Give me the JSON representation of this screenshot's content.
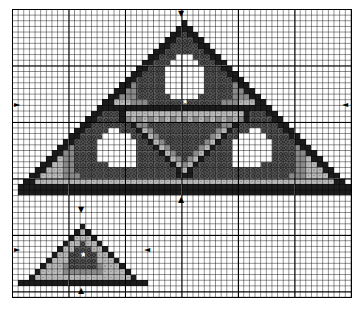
{
  "chart_data": {
    "type": "heatmap",
    "title": "",
    "grid": {
      "columns": 60,
      "rows": 51,
      "major_every": 10,
      "cell_px": 5.65
    },
    "legend": {
      "K": {
        "name": "black",
        "color": "#1c1c1c"
      },
      "D": {
        "name": "dark-gray-symbol",
        "color": "#5e5e5e"
      },
      "M": {
        "name": "medium-gray",
        "color": "#8a8a8a"
      },
      "L": {
        "name": "light-gray-symbol",
        "color": "#b9b9b9"
      },
      "W": {
        "name": "white",
        "color": "#ffffff"
      },
      "S": {
        "name": "center-star",
        "color": "#ffffff"
      }
    },
    "star_glyph": "★",
    "rows": [
      {
        "r": 2,
        "start": 30,
        "cells": "K"
      },
      {
        "r": 3,
        "start": 29,
        "cells": "KKK"
      },
      {
        "r": 4,
        "start": 28,
        "cells": "KKDKK"
      },
      {
        "r": 5,
        "start": 27,
        "cells": "KKDDDKK"
      },
      {
        "r": 6,
        "start": 26,
        "cells": "KKDDDDDKK"
      },
      {
        "r": 7,
        "start": 25,
        "cells": "KKDDDDDDDKK"
      },
      {
        "r": 8,
        "start": 24,
        "cells": "KKDDDWWWDDDKK"
      },
      {
        "r": 9,
        "start": 23,
        "cells": "KKDDDWWWWWDDDKK"
      },
      {
        "r": 10,
        "start": 22,
        "cells": "KKDDDWWWWWWWDDDKK"
      },
      {
        "r": 11,
        "start": 21,
        "cells": "KKDDDDWWWWWWWDDDDKK"
      },
      {
        "r": 12,
        "start": 20,
        "cells": "KKDDDDDWWWWWWWDDDDDKK"
      },
      {
        "r": 13,
        "start": 19,
        "cells": "KKMDDDDDWWWWWWWDDDDDMKK"
      },
      {
        "r": 14,
        "start": 18,
        "cells": "KKMMDDDDDWWWWWWWDDDDDMMKK"
      },
      {
        "r": 15,
        "start": 17,
        "cells": "KKMMMDDDDDDWWWWWDDDDDDMMMKK"
      },
      {
        "r": 16,
        "start": 16,
        "cells": "KKLLLMMMDDDDDDSDDDDDDMMMLLLKK"
      },
      {
        "r": 17,
        "start": 15,
        "cells": "KKKKKKKKKKKKKKKKKKKKKKKKKKKKKKK"
      },
      {
        "r": 18,
        "start": 14,
        "cells": "KKDDDKLLLLLLLLLLLLLLLLLLLLLKDDDKK"
      },
      {
        "r": 19,
        "start": 13,
        "cells": "KKDDDDKMLMLMLMLMLMLMLMLMLMLMKDDDDKK"
      },
      {
        "r": 20,
        "start": 12,
        "cells": "KKDDDDDDDKMMDDDDDDDDDDDDDMMKDDDDDDDKK"
      },
      {
        "r": 21,
        "start": 11,
        "cells": "KKDDDDWWDDDKLMDDDDDDDDDDDMLKDDDWWDDDDKK"
      },
      {
        "r": 22,
        "start": 10,
        "cells": "KKDDDDWWWWWDDKLMDDDDDDDDDMLKDDWWWWWDDDDKK"
      },
      {
        "r": 23,
        "start": 9,
        "cells": "KKDDDDWWWWWWWDDKLMDDDDDDDMLKDDWWWWWWWDDDDKK"
      },
      {
        "r": 24,
        "start": 8,
        "cells": "KKMDDDDWWWWWWWDDDKLMDDDDDMLKDDDWWWWWWWDDDDMKK"
      },
      {
        "r": 25,
        "start": 7,
        "cells": "KKMMDDDDWWWWWWWDDDDKLMDDDMLKDDDDWWWWWWWDDDDMMKK"
      },
      {
        "r": 26,
        "start": 6,
        "cells": "KKLMMDDDDWWWWWWWDDDDDKLMDMLKDDDDDWWWWWWWDDDDMMLKK"
      },
      {
        "r": 27,
        "start": 5,
        "cells": "KKLLMMDDDDDDWWWWWDDDDDDKLMLKDDDDDDWWWWWDDDDDDMMLLKK"
      },
      {
        "r": 28,
        "start": 4,
        "cells": "KKLLLMMDDDDDDDDDDDDDDDDDDKLKDDDDDDDDDDDDDDDDDDMMLLLKK"
      },
      {
        "r": 29,
        "start": 3,
        "cells": "KKLLLLMMMDDDDDDDDDDDDDDDDDKKKDDDDDDDDDDDDDDDDDMMMLLLLKK"
      },
      {
        "r": 30,
        "start": 2,
        "cells": "KKLLLLLLLLLLLLLLLLLLLLLLLLLLLLLLLLLLLLLLLLLLLLLLLLLLLLLKK"
      },
      {
        "r": 31,
        "start": 1,
        "cells": "KKKKKKKKKKKKKKKKKKKKKKKKKKKKKKKKKKKKKKKKKKKKKKKKKKKKKKKKKKK"
      },
      {
        "r": 32,
        "start": 1,
        "cells": "KKKKKKKKKKKKKKKKKKKKKKKKKKKKKKKKKKKKKKKKKKKKKKKKKKKKKKKKKKK"
      },
      {
        "r": 38,
        "start": 12,
        "cells": "K"
      },
      {
        "r": 39,
        "start": 11,
        "cells": "KLK"
      },
      {
        "r": 40,
        "start": 10,
        "cells": "KLLLK"
      },
      {
        "r": 41,
        "start": 9,
        "cells": "KLLDLLK"
      },
      {
        "r": 42,
        "start": 8,
        "cells": "KLLDDDLLK"
      },
      {
        "r": 43,
        "start": 7,
        "cells": "KLLDDSDDLLK"
      },
      {
        "r": 44,
        "start": 6,
        "cells": "KLLLDDDDDLLLK"
      },
      {
        "r": 45,
        "start": 5,
        "cells": "KLLLMDDDDDMLLLK"
      },
      {
        "r": 46,
        "start": 4,
        "cells": "KLLLLMMMMMMMLLLLK"
      },
      {
        "r": 47,
        "start": 3,
        "cells": "KLLLLLLLLLLLLLLLLLK"
      },
      {
        "r": 48,
        "start": 1,
        "cells": "KKKKKKKKKKKKKKKKKKKKKKK"
      }
    ],
    "center_arrows": [
      {
        "name": "large-motif-top-arrow",
        "glyph": "▼",
        "x": 177,
        "y": 10
      },
      {
        "name": "large-motif-bottom-arrow",
        "glyph": "▲",
        "x": 177,
        "y": 196
      },
      {
        "name": "large-motif-left-arrow",
        "glyph": "►",
        "x": 13,
        "y": 101
      },
      {
        "name": "large-motif-right-arrow",
        "glyph": "◄",
        "x": 341,
        "y": 101
      },
      {
        "name": "small-motif-top-arrow",
        "glyph": "▼",
        "x": 77,
        "y": 206
      },
      {
        "name": "small-motif-bottom-arrow",
        "glyph": "▲",
        "x": 77,
        "y": 287
      },
      {
        "name": "small-motif-left-arrow",
        "glyph": "►",
        "x": 13,
        "y": 246
      },
      {
        "name": "small-motif-right-arrow",
        "glyph": "◄",
        "x": 143,
        "y": 246
      }
    ]
  }
}
